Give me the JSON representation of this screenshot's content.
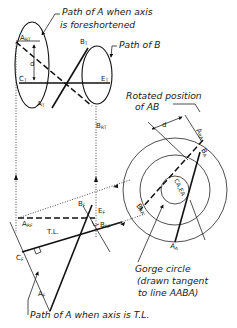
{
  "captions": {
    "path_a_foreshortened_line1": "Path of A when axis",
    "path_a_foreshortened_line2": "is foreshortened",
    "path_b": "Path of B",
    "rotated_position_line1": "Rotated position",
    "rotated_position_line2": "of AB",
    "gorge_circle_line1": "Gorge circle",
    "gorge_circle_line2": "(drawn tangent",
    "gorge_circle_line3": "to line AABA)",
    "path_a_tl": "Path of A when axis is T.L."
  },
  "point_labels": {
    "a_rt": {
      "main": "A",
      "sub": "RT"
    },
    "b_t": {
      "main": "B",
      "sub": "T"
    },
    "c_t": {
      "main": "C",
      "sub": "T"
    },
    "e_t": {
      "main": "E",
      "sub": "T"
    },
    "a_t": {
      "main": "A",
      "sub": "T"
    },
    "b_rt": {
      "main": "B",
      "sub": "RT"
    },
    "d_top": "d",
    "d_right": "d",
    "a_ra": {
      "main": "A",
      "sub": "RA"
    },
    "b_a": {
      "main": "B",
      "sub": "A"
    },
    "ca_ea": "CA,EA",
    "b_ra": {
      "main": "B",
      "sub": "RA"
    },
    "a_a": {
      "main": "A",
      "sub": "A"
    },
    "b_f": {
      "main": "B",
      "sub": "F"
    },
    "e_f": {
      "main": "E",
      "sub": "F"
    },
    "a_rf": {
      "main": "A",
      "sub": "RF"
    },
    "b_rf": {
      "main": "B",
      "sub": "RF"
    },
    "tl": "T.L.",
    "c_f": {
      "main": "C",
      "sub": "F"
    },
    "a_f": {
      "main": "A",
      "sub": "F"
    }
  }
}
